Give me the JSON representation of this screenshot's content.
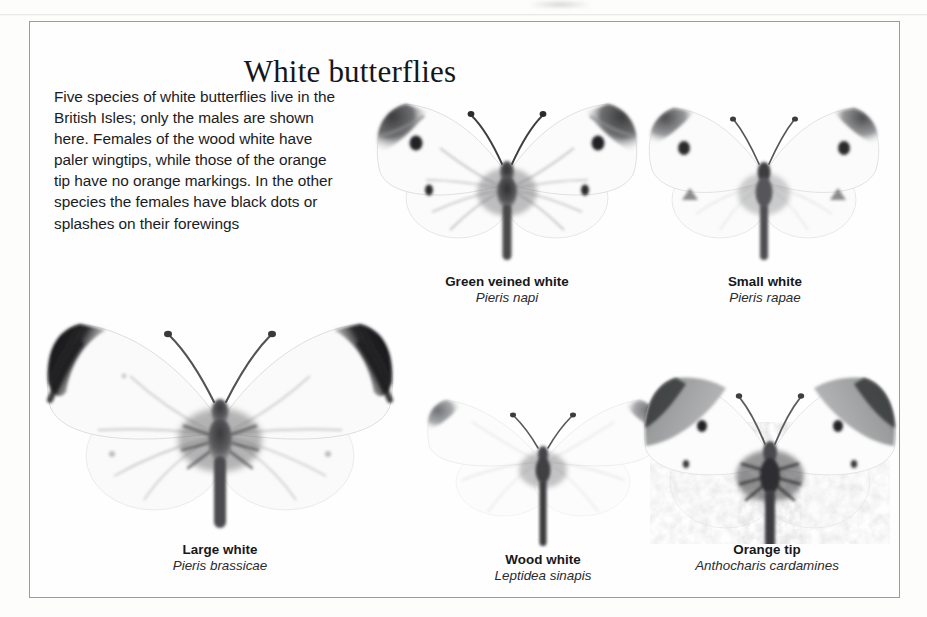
{
  "page": {
    "title": "White butterflies",
    "intro": "Five species of white butterflies live in the British Isles; only the males are shown here. Females of the wood white have paler wingtips, while those of the orange tip have no orange markings. In the other species the females have black dots or splashes on their forewings"
  },
  "specimens": [
    {
      "id": "green-veined-white",
      "common_name": "Green veined white",
      "scientific_name": "Pieris napi"
    },
    {
      "id": "small-white",
      "common_name": "Small white",
      "scientific_name": "Pieris rapae"
    },
    {
      "id": "large-white",
      "common_name": "Large white",
      "scientific_name": "Pieris brassicae"
    },
    {
      "id": "wood-white",
      "common_name": "Wood white",
      "scientific_name": "Leptidea sinapis"
    },
    {
      "id": "orange-tip",
      "common_name": "Orange tip",
      "scientific_name": "Anthocharis cardamines"
    }
  ],
  "colors": {
    "page_background": "#fdfdfc",
    "frame_border": "#9b9b9b",
    "text": "#17181b",
    "wing_white": "#fafafa",
    "wing_tip_dark": "#2b2b2d",
    "wing_tip_mid": "#8d8d8f",
    "body_dark": "#3a3a3c",
    "orange_patch": "#a9a9a8"
  }
}
